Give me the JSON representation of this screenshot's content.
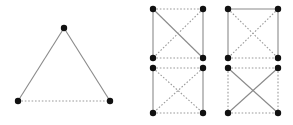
{
  "figure": {
    "title": "",
    "background_color": "#ffffff",
    "node_color": "#111111",
    "solid_edge_color": "#8a8a8a",
    "dotted_edge_color": "#9a9a9a",
    "node_radius": 3.2,
    "width": 293,
    "height": 125
  },
  "chart_data": {
    "type": "diagram",
    "title": "",
    "panels": [
      {
        "name": "triangle",
        "label": "",
        "graph": "K3",
        "nodes": [
          {
            "id": "apex",
            "x": 64,
            "y": 28
          },
          {
            "id": "bottom-left",
            "x": 18,
            "y": 101
          },
          {
            "id": "bottom-right",
            "x": 110,
            "y": 101
          }
        ],
        "edges": [
          {
            "from": "apex",
            "to": "bottom-left",
            "style": "solid"
          },
          {
            "from": "apex",
            "to": "bottom-right",
            "style": "solid"
          },
          {
            "from": "bottom-left",
            "to": "bottom-right",
            "style": "dotted"
          }
        ],
        "solid_count": 2,
        "dotted_count": 1
      },
      {
        "name": "square-top-left",
        "label": "",
        "graph": "K4",
        "nodes": [
          {
            "id": "tl",
            "x": 153,
            "y": 9
          },
          {
            "id": "tr",
            "x": 203,
            "y": 9
          },
          {
            "id": "bl",
            "x": 153,
            "y": 58
          },
          {
            "id": "br",
            "x": 203,
            "y": 58
          }
        ],
        "edges": [
          {
            "from": "tl",
            "to": "tr",
            "style": "dotted"
          },
          {
            "from": "tl",
            "to": "bl",
            "style": "solid"
          },
          {
            "from": "tr",
            "to": "br",
            "style": "solid"
          },
          {
            "from": "bl",
            "to": "br",
            "style": "dotted"
          },
          {
            "from": "tl",
            "to": "br",
            "style": "solid"
          },
          {
            "from": "tr",
            "to": "bl",
            "style": "dotted"
          }
        ],
        "solid_count": 3,
        "dotted_count": 3
      },
      {
        "name": "square-top-right",
        "label": "",
        "graph": "K4",
        "nodes": [
          {
            "id": "tl",
            "x": 228,
            "y": 9
          },
          {
            "id": "tr",
            "x": 278,
            "y": 9
          },
          {
            "id": "bl",
            "x": 228,
            "y": 58
          },
          {
            "id": "br",
            "x": 278,
            "y": 58
          }
        ],
        "edges": [
          {
            "from": "tl",
            "to": "tr",
            "style": "solid"
          },
          {
            "from": "tl",
            "to": "bl",
            "style": "solid"
          },
          {
            "from": "tr",
            "to": "br",
            "style": "solid"
          },
          {
            "from": "bl",
            "to": "br",
            "style": "dotted"
          },
          {
            "from": "tl",
            "to": "br",
            "style": "dotted"
          },
          {
            "from": "tr",
            "to": "bl",
            "style": "dotted"
          }
        ],
        "solid_count": 3,
        "dotted_count": 3
      },
      {
        "name": "square-bottom-left",
        "label": "",
        "graph": "K4",
        "nodes": [
          {
            "id": "tl",
            "x": 153,
            "y": 68
          },
          {
            "id": "tr",
            "x": 203,
            "y": 68
          },
          {
            "id": "bl",
            "x": 153,
            "y": 113
          },
          {
            "id": "br",
            "x": 203,
            "y": 113
          }
        ],
        "edges": [
          {
            "from": "tl",
            "to": "tr",
            "style": "dotted"
          },
          {
            "from": "tl",
            "to": "bl",
            "style": "solid"
          },
          {
            "from": "tr",
            "to": "br",
            "style": "solid"
          },
          {
            "from": "bl",
            "to": "br",
            "style": "dotted"
          },
          {
            "from": "tl",
            "to": "br",
            "style": "dotted"
          },
          {
            "from": "tr",
            "to": "bl",
            "style": "dotted"
          }
        ],
        "solid_count": 2,
        "dotted_count": 4
      },
      {
        "name": "square-bottom-right",
        "label": "",
        "graph": "K4",
        "nodes": [
          {
            "id": "tl",
            "x": 228,
            "y": 68
          },
          {
            "id": "tr",
            "x": 278,
            "y": 68
          },
          {
            "id": "bl",
            "x": 228,
            "y": 113
          },
          {
            "id": "br",
            "x": 278,
            "y": 113
          }
        ],
        "edges": [
          {
            "from": "tl",
            "to": "tr",
            "style": "dotted"
          },
          {
            "from": "tl",
            "to": "bl",
            "style": "dotted"
          },
          {
            "from": "tr",
            "to": "br",
            "style": "dotted"
          },
          {
            "from": "bl",
            "to": "br",
            "style": "dotted"
          },
          {
            "from": "tl",
            "to": "br",
            "style": "solid"
          },
          {
            "from": "tr",
            "to": "bl",
            "style": "solid"
          }
        ],
        "solid_count": 2,
        "dotted_count": 4
      }
    ]
  }
}
